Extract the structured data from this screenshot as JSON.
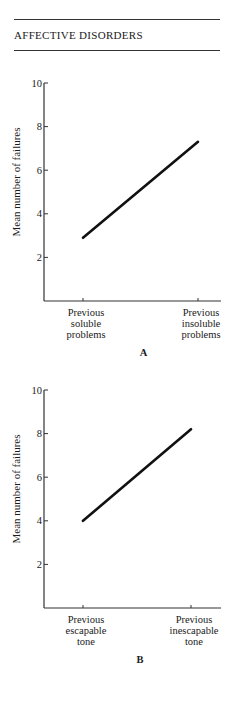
{
  "header": {
    "title": "AFFECTIVE DISORDERS"
  },
  "chart_data": [
    {
      "type": "line",
      "panel_label": "A",
      "title": "",
      "xlabel": "",
      "ylabel": "Mean number of failures",
      "ylim": [
        0,
        10
      ],
      "yticks": [
        2,
        4,
        6,
        8,
        10
      ],
      "categories": [
        "Previous soluble problems",
        "Previous insoluble problems"
      ],
      "category_lines": [
        [
          "Previous",
          "soluble",
          "problems"
        ],
        [
          "Previous",
          "insoluble",
          "problems"
        ]
      ],
      "series": [
        {
          "name": "Mean failures",
          "values": [
            2.9,
            7.3
          ]
        }
      ],
      "grid": false,
      "legend": null
    },
    {
      "type": "line",
      "panel_label": "B",
      "title": "",
      "xlabel": "",
      "ylabel": "Mean number of failures",
      "ylim": [
        0,
        10
      ],
      "yticks": [
        2,
        4,
        6,
        8,
        10
      ],
      "categories": [
        "Previous escapable tone",
        "Previous inescapable tone"
      ],
      "category_lines": [
        [
          "Previous",
          "escapable",
          "tone"
        ],
        [
          "Previous",
          "inescapable",
          "tone"
        ]
      ],
      "series": [
        {
          "name": "Mean failures",
          "values": [
            4.0,
            8.2
          ]
        }
      ],
      "grid": false,
      "legend": null
    }
  ]
}
